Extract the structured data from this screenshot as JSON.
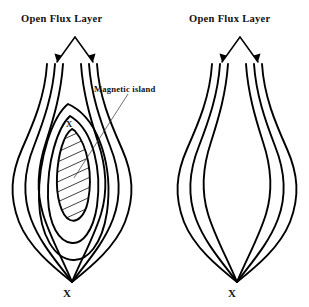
{
  "figure": {
    "title_left": "Open Flux Layer",
    "title_right": "Open Flux Layer",
    "island_label": "Magnetic island",
    "x_point_mark": "X",
    "o_point_mark": "X",
    "colors": {
      "ink": "#000000",
      "background": "#ffffff",
      "leader": "#333333"
    }
  },
  "panels": [
    {
      "id": "left",
      "name": "with-magnetic-island",
      "title": "Open Flux Layer",
      "has_island": true,
      "island_label": "Magnetic island",
      "island_hatched": true,
      "flux_bundle_count": 2,
      "lines_per_bundle": 3,
      "nested_contours": 4,
      "bottom_mark": "X",
      "upper_mark": "X"
    },
    {
      "id": "right",
      "name": "without-magnetic-island",
      "title": "Open Flux Layer",
      "has_island": false,
      "flux_bundle_count": 2,
      "lines_per_bundle": 3,
      "nested_contours": 3,
      "bottom_mark": "X",
      "upper_mark": ""
    }
  ]
}
